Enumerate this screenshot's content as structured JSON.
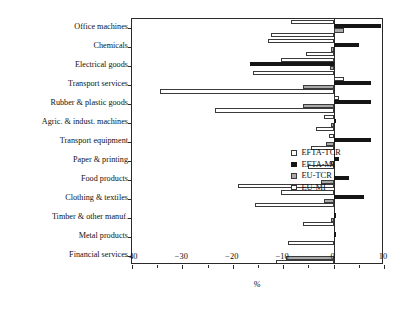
{
  "chart_data": {
    "type": "bar",
    "orientation": "horizontal",
    "title": "",
    "xlabel": "%",
    "ylabel": "",
    "xlim": [
      -40,
      10
    ],
    "xticks": [
      -40,
      -30,
      -20,
      -10,
      0,
      10
    ],
    "xtick_labels": [
      "−40",
      "−30",
      "−20",
      "−10",
      "0",
      "10"
    ],
    "grid": false,
    "legend_position": "center-left-inside",
    "categories": [
      "Office machines",
      "Chemicals",
      "Electrical goods",
      "Transport services",
      "Rubber & plastic goods",
      "Agric. & indust. machines",
      "Transport equipment",
      "Paper & printing",
      "Food products",
      "Clothing & textiles",
      "Timber & other manuf.",
      "Metal products",
      "Financial services"
    ],
    "series": [
      {
        "name": "EFTA-TCR",
        "swatch": "open-square",
        "color": "#ffffff",
        "edge": "#3a3a3a",
        "values": [
          -8.5,
          -13.0,
          -10.5,
          2.0,
          1.0,
          -2.0,
          -1.0,
          0.0,
          0.0,
          -10.5,
          0.0,
          0.0,
          0.0
        ]
      },
      {
        "name": "EFTA-MI",
        "swatch": "filled-square",
        "color": "#151515",
        "edge": "#151515",
        "values": [
          9.5,
          5.0,
          -16.5,
          7.5,
          7.5,
          0.5,
          7.5,
          1.0,
          3.0,
          6.0,
          0.5,
          0.5,
          0.0
        ]
      },
      {
        "name": "EU-TCR",
        "swatch": "gray-square",
        "color": "#a9a9a9",
        "edge": "#3a3a3a",
        "values": [
          2.0,
          -0.5,
          -0.8,
          -6.0,
          -6.0,
          -0.5,
          -1.5,
          -0.5,
          -2.5,
          -2.0,
          -0.5,
          0.0,
          -9.5
        ]
      },
      {
        "name": "EU-MI",
        "swatch": "open-square",
        "color": "#ffffff",
        "edge": "#3a3a3a",
        "values": [
          -12.5,
          -5.5,
          -16.0,
          -34.5,
          -23.5,
          -3.5,
          -4.5,
          -5.0,
          -19.0,
          -15.5,
          -6.0,
          -9.0,
          -11.5
        ]
      }
    ]
  }
}
